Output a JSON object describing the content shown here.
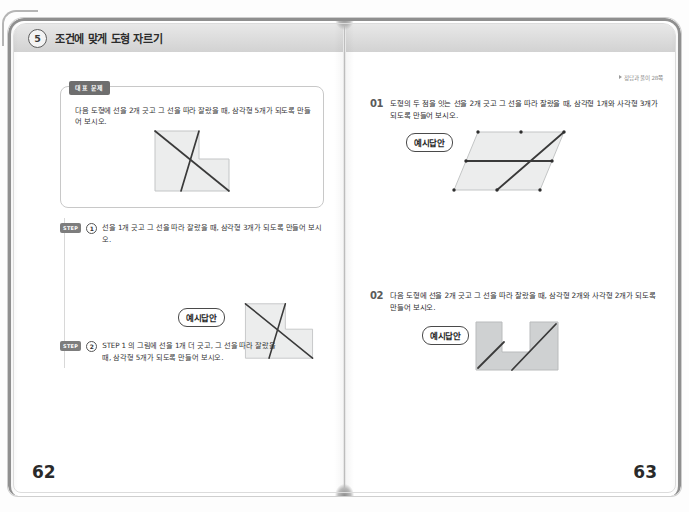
{
  "header": {
    "chapter_number": "5",
    "chapter_title": "조건에 맞게 도형 자르기"
  },
  "left_page": {
    "page_number": "62",
    "representative": {
      "tag": "대표 문제",
      "text": "다음 도형에 선을 2개 긋고 그 선을 따라 잘랐을 때, 삼각형 5개가 되도록 만들어 보시오.",
      "figure": "l-shape-two-crossing-lines"
    },
    "steps": [
      {
        "chip": "STEP",
        "number": "1",
        "text": "선을 1개 긋고 그 선을 따라 잘랐을 때, 삼각형 3개가 되도록 만들어 보시오."
      },
      {
        "chip": "STEP",
        "number": "2",
        "text": "STEP 1 의 그림에 선을 1개 더 긋고, 그 선을 따라 잘랐을 때, 삼각형 5개가 되도록 만들어 보시오.",
        "answer_badge": "예시답안",
        "figure": "l-shape-two-crossing-lines"
      }
    ]
  },
  "right_page": {
    "page_number": "63",
    "reference_note": "정답과 풀이 28쪽",
    "problems": [
      {
        "number": "01",
        "text": "도형의 두 점을 잇는 선을 2개 긋고 그 선을 따라 잘랐을 때, 삼각형 1개와 사각형 3개가 되도록 만들어 보시오.",
        "answer_badge": "예시답안",
        "figure": "parallelogram-with-marked-points"
      },
      {
        "number": "02",
        "text": "다음 도형에 선을 2개 긋고 그 선을 따라 잘랐을 때, 삼각형 2개와 사각형 2개가 되도록 만들어 보시오.",
        "answer_badge": "예시답안",
        "figure": "u-shape-two-parallel-lines"
      }
    ]
  },
  "colors": {
    "figure_fill": "#eceded",
    "figure_stroke": "#b9bbbc",
    "cut_line": "#3a3a3a",
    "bar_bg": "#dcdcdc"
  }
}
